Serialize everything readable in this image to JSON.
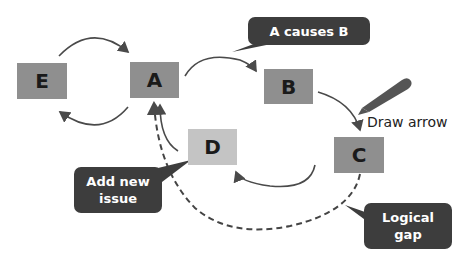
{
  "nodes": {
    "e": "E",
    "a": "A",
    "b": "B",
    "c": "C",
    "d": "D"
  },
  "callouts": {
    "a_causes_b": "A causes B",
    "add_new_issue": "Add new issue",
    "logical_gap": "Logical gap"
  },
  "labels": {
    "draw_arrow": "Draw arrow"
  },
  "colors": {
    "node_fill": "#8f8f8f",
    "node_light_fill": "#c4c4c4",
    "callout_fill": "#3d3d3d",
    "arrow": "#4a4a4a"
  }
}
